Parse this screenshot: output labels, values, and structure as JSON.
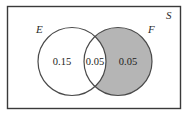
{
  "figure": {
    "type": "venn-diagram",
    "universal_set": {
      "label": "S",
      "border_color": "#3a3a3a",
      "fill_color": "#ffffff"
    },
    "sets": [
      {
        "id": "E",
        "label": "E",
        "fill_color": "#ffffff",
        "stroke_color": "#4a4a4a"
      },
      {
        "id": "F",
        "label": "F",
        "fill_color": "#b5b5b5",
        "stroke_color": "#4a4a4a",
        "shaded": true
      }
    ],
    "regions": [
      {
        "id": "E-only",
        "value": "0.15",
        "fill_color": "#ffffff"
      },
      {
        "id": "E-and-F",
        "value": "0.05",
        "fill_color": "#ffffff"
      },
      {
        "id": "F-only",
        "value": "0.05",
        "fill_color": "#b5b5b5"
      }
    ]
  }
}
